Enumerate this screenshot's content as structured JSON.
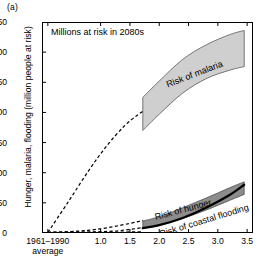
{
  "panel": {
    "label": "(a)"
  },
  "annotation": {
    "text": "Millions at risk in 2080s"
  },
  "chart_data": {
    "type": "area",
    "title": "Millions at risk in 2080s",
    "xlabel": "",
    "ylabel": "Hunger, malaria, flooding (million people at risk)",
    "ylim": [
      0,
      350
    ],
    "xlim": [
      0.0,
      3.6
    ],
    "yticks": [
      0,
      50,
      100,
      150,
      200,
      250,
      300,
      350
    ],
    "xticks": [
      "1961–1990",
      "1.0",
      "1.5",
      "2.0",
      "2.5",
      "3.0",
      "3.5"
    ],
    "xtick_values": [
      0.1,
      1.0,
      1.5,
      2.0,
      2.5,
      3.0,
      3.5
    ],
    "xtick_sublabel": "average",
    "grid": false,
    "legend_position": "inline-labels",
    "series": [
      {
        "name": "Risk of malaria",
        "style": "shaded-band",
        "color": "#cfcfcf",
        "label": "Risk of malaria",
        "x": [
          1.72,
          2.0,
          2.4,
          2.8,
          3.2,
          3.45
        ],
        "upper": [
          225,
          252,
          288,
          312,
          329,
          336
        ],
        "lower": [
          170,
          197,
          232,
          256,
          270,
          276
        ]
      },
      {
        "name": "Risk of hunger",
        "style": "shaded-band",
        "color": "#8c8c8c",
        "label": "Risk of hunger",
        "x": [
          1.72,
          2.0,
          2.4,
          2.8,
          3.2,
          3.45
        ],
        "upper": [
          20,
          27,
          42,
          58,
          75,
          85
        ],
        "lower": [
          8,
          13,
          24,
          38,
          54,
          64
        ]
      },
      {
        "name": "Risk of coastal flooding",
        "style": "thick-line",
        "color": "#000000",
        "label": "Risk of coastal flooding",
        "x": [
          1.72,
          2.0,
          2.4,
          2.8,
          3.2,
          3.45
        ],
        "values": [
          8,
          13,
          25,
          42,
          63,
          80
        ]
      },
      {
        "name": "Malaria projection",
        "style": "dashed",
        "color": "#000000",
        "x": [
          0.1,
          0.45,
          0.8,
          1.1,
          1.4,
          1.62,
          1.72
        ],
        "values": [
          1,
          52,
          104,
          144,
          177,
          195,
          202
        ]
      },
      {
        "name": "Hunger projection",
        "style": "dashed",
        "color": "#000000",
        "x": [
          0.1,
          0.6,
          1.0,
          1.35,
          1.6,
          1.72
        ],
        "values": [
          1,
          3,
          7,
          13,
          18,
          21
        ]
      },
      {
        "name": "Coastal flooding projection",
        "style": "dashed",
        "color": "#000000",
        "x": [
          0.1,
          0.7,
          1.2,
          1.5,
          1.72
        ],
        "values": [
          1,
          1.5,
          3,
          6,
          9
        ]
      },
      {
        "name": "Baseline",
        "style": "dashed-flat",
        "color": "#000000",
        "x": [
          0.1,
          0.8,
          1.3,
          1.72
        ],
        "values": [
          1,
          1,
          1.5,
          2
        ]
      }
    ]
  }
}
